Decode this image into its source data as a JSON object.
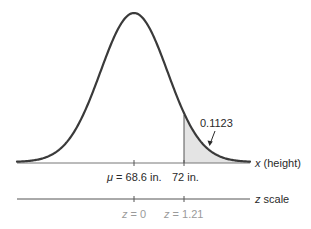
{
  "diagram": {
    "type": "normal-distribution",
    "colors": {
      "curve": "#3a3a3a",
      "axis": "#555555",
      "shade": "#e4e4e4",
      "label": "#2a2a2a",
      "z_label": "#9a9a9a"
    },
    "shaded_area": {
      "label": "0.1123"
    },
    "x_axis": {
      "var": "x",
      "title": " (height)",
      "ticks": [
        {
          "mu_symbol": "μ",
          "text": " = 68.6 in."
        },
        {
          "text": "72 in."
        }
      ]
    },
    "z_axis": {
      "var": "z",
      "title": " scale",
      "ticks": [
        {
          "var": "z",
          "text": " = 0"
        },
        {
          "var": "z",
          "text": " = 1.21"
        }
      ]
    }
  },
  "chart_data": {
    "type": "area",
    "title": "",
    "distribution": "normal",
    "mean": 68.6,
    "x_marker": 72,
    "z_values": [
      0,
      1.21
    ],
    "shaded_region": "x > 72",
    "shaded_probability": 0.1123,
    "xlabel": "x (height)",
    "secondary_axis_label": "z scale"
  }
}
